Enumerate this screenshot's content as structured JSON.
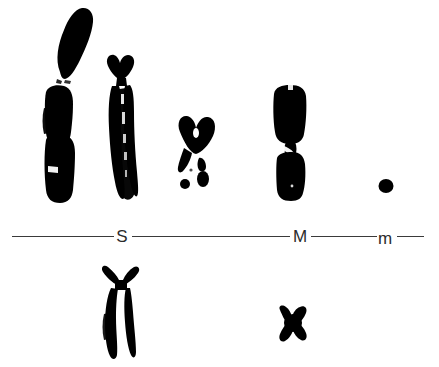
{
  "figure": {
    "type": "karyotype-micrograph",
    "background_color": "#ffffff",
    "ink_color": "#000000",
    "width": 439,
    "height": 367,
    "caption_text": ""
  },
  "scale": {
    "line_color": "#3a3a3a",
    "label_color": "#2b2b2b",
    "y": 236,
    "labels": [
      {
        "text": "S",
        "x": 122,
        "y": 228,
        "meaning": "large-chromosome-class"
      },
      {
        "text": "M",
        "x": 299,
        "y": 228,
        "meaning": "medium-chromosome-class"
      },
      {
        "text": "m",
        "x": 385,
        "y": 230,
        "meaning": "micro-chromosome-class"
      }
    ],
    "segments": [
      {
        "x1": 12,
        "x2": 114
      },
      {
        "x1": 132,
        "x2": 290
      },
      {
        "x1": 311,
        "x2": 377
      },
      {
        "x1": 397,
        "x2": 424
      }
    ]
  },
  "top_row": {
    "group_label": "metaphase-chromosomes-upper-row",
    "items": [
      {
        "name": "chromosome-1",
        "class": "S",
        "morphology": "acrocentric-long-arm-with-detached-short-arm",
        "x": 30,
        "y": 5,
        "w": 62,
        "h": 200
      },
      {
        "name": "chromosome-2",
        "class": "S",
        "morphology": "submetacentric-paired-chromatids",
        "x": 98,
        "y": 55,
        "w": 48,
        "h": 150
      },
      {
        "name": "chromosome-3",
        "class": "S",
        "morphology": "small-v-shaped-with-fragments",
        "x": 172,
        "y": 118,
        "w": 48,
        "h": 75
      },
      {
        "name": "chromosome-4",
        "class": "M",
        "morphology": "metacentric-two-blocks",
        "x": 268,
        "y": 82,
        "w": 48,
        "h": 118
      },
      {
        "name": "chromosome-5",
        "class": "m",
        "morphology": "microchromosome-dot",
        "x": 378,
        "y": 180,
        "w": 14,
        "h": 14
      }
    ]
  },
  "bottom_row": {
    "group_label": "metaphase-chromosomes-lower-row",
    "items": [
      {
        "name": "chromosome-6",
        "class": "S",
        "morphology": "x-shaped-crossed-chromatids",
        "x": 95,
        "y": 268,
        "w": 50,
        "h": 90
      },
      {
        "name": "chromosome-7",
        "class": "M",
        "morphology": "small-metacentric-x",
        "x": 275,
        "y": 308,
        "w": 36,
        "h": 36
      }
    ]
  }
}
